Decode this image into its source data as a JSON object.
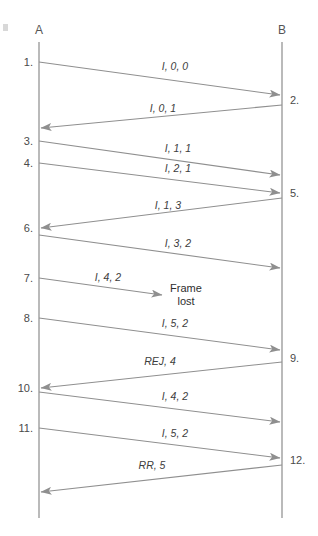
{
  "diagram": {
    "stations": [
      {
        "name": "A",
        "label": "A",
        "x": 39
      },
      {
        "name": "B",
        "label": "B",
        "x": 282
      }
    ],
    "colors": {
      "line": "#8f8f8f",
      "lifeline": "#8c8c8c",
      "text": "#3d3d3d",
      "background": "#ffffff"
    },
    "lifeline": {
      "top": 42,
      "bottom": 518
    },
    "steps_left": [
      {
        "id": "step-1",
        "label": "1.",
        "y": 62
      },
      {
        "id": "step-3",
        "label": "3.",
        "y": 141
      },
      {
        "id": "step-4",
        "label": "4.",
        "y": 163
      },
      {
        "id": "step-6",
        "label": "6.",
        "y": 228
      },
      {
        "id": "step-7",
        "label": "7.",
        "y": 278
      },
      {
        "id": "step-8",
        "label": "8.",
        "y": 318
      },
      {
        "id": "step-10",
        "label": "10.",
        "y": 388
      },
      {
        "id": "step-11",
        "label": "11.",
        "y": 428
      }
    ],
    "steps_right": [
      {
        "id": "step-2",
        "label": "2.",
        "y": 100
      },
      {
        "id": "step-5",
        "label": "5.",
        "y": 193
      },
      {
        "id": "step-9",
        "label": "9.",
        "y": 358
      },
      {
        "id": "step-12",
        "label": "12.",
        "y": 460
      }
    ],
    "messages": [
      {
        "id": "msg-1",
        "label": "I, 0, 0",
        "direction": "a-to-b",
        "from_y": 62,
        "to_y": 95,
        "label_x": 175,
        "label_y": 70,
        "truncated": false
      },
      {
        "id": "msg-2",
        "label": "I, 0, 1",
        "direction": "b-to-a",
        "from_y": 105,
        "to_y": 128,
        "label_x": 163,
        "label_y": 112,
        "truncated": false
      },
      {
        "id": "msg-3",
        "label": "I, 1, 1",
        "direction": "a-to-b",
        "from_y": 141,
        "to_y": 175,
        "label_x": 178,
        "label_y": 152,
        "truncated": false
      },
      {
        "id": "msg-4",
        "label": "I, 2, 1",
        "direction": "a-to-b",
        "from_y": 163,
        "to_y": 193,
        "label_x": 178,
        "label_y": 172,
        "truncated": false
      },
      {
        "id": "msg-5",
        "label": "I, 1, 3",
        "direction": "b-to-a",
        "from_y": 198,
        "to_y": 228,
        "label_x": 168,
        "label_y": 209,
        "truncated": false
      },
      {
        "id": "msg-6",
        "label": "I, 3, 2",
        "direction": "a-to-b",
        "from_y": 235,
        "to_y": 268,
        "label_x": 178,
        "label_y": 247,
        "truncated": false
      },
      {
        "id": "msg-7",
        "label": "I, 4, 2",
        "direction": "a-to-lost",
        "from_y": 278,
        "to_y": 295,
        "label_x": 108,
        "label_y": 281,
        "truncated": true,
        "end_x": 162
      },
      {
        "id": "msg-8",
        "label": "I, 5, 2",
        "direction": "a-to-b",
        "from_y": 318,
        "to_y": 350,
        "label_x": 175,
        "label_y": 327,
        "truncated": false
      },
      {
        "id": "msg-9",
        "label": "REJ, 4",
        "direction": "b-to-a",
        "from_y": 362,
        "to_y": 388,
        "label_x": 160,
        "label_y": 365,
        "truncated": false
      },
      {
        "id": "msg-10",
        "label": "I, 4, 2",
        "direction": "a-to-b",
        "from_y": 392,
        "to_y": 422,
        "label_x": 175,
        "label_y": 400,
        "truncated": false
      },
      {
        "id": "msg-11",
        "label": "I, 5, 2",
        "direction": "a-to-b",
        "from_y": 428,
        "to_y": 458,
        "label_x": 175,
        "label_y": 437,
        "truncated": false
      },
      {
        "id": "msg-12",
        "label": "RR, 5",
        "direction": "b-to-a",
        "from_y": 465,
        "to_y": 492,
        "label_x": 152,
        "label_y": 469,
        "truncated": false
      }
    ],
    "notes": [
      {
        "id": "frame-lost-note",
        "line1": "Frame",
        "line2": "lost",
        "x": 186,
        "y": 292
      }
    ]
  }
}
